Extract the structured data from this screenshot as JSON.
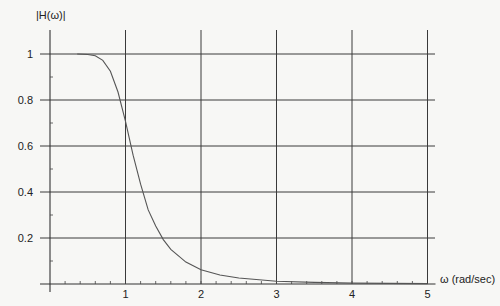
{
  "chart_data": {
    "type": "line",
    "title": "",
    "ylabel": "|H(ω)|",
    "xlabel": "ω (rad/sec)",
    "xlim": [
      0,
      5
    ],
    "ylim": [
      0,
      1
    ],
    "grid": true,
    "legend": null,
    "x_ticks": [
      1,
      2,
      3,
      4,
      5
    ],
    "x_tick_labels": [
      "1",
      "2",
      "3",
      "4",
      "5"
    ],
    "y_ticks": [
      0.2,
      0.4,
      0.6,
      0.8,
      1
    ],
    "y_tick_labels": [
      "0.2",
      "0.4",
      "0.6",
      "0.8",
      "1"
    ],
    "x_minor_tick_step": 0.2,
    "series": [
      {
        "name": "|H(ω)|",
        "x": [
          0.36,
          0.5,
          0.6,
          0.7,
          0.8,
          0.9,
          1.0,
          1.1,
          1.2,
          1.3,
          1.4,
          1.5,
          1.6,
          1.8,
          2.0,
          2.25,
          2.5,
          3.0,
          3.5,
          4.0,
          4.5,
          5.0
        ],
        "values": [
          1.0,
          0.998,
          0.992,
          0.972,
          0.925,
          0.835,
          0.707,
          0.56,
          0.434,
          0.322,
          0.252,
          0.193,
          0.151,
          0.095,
          0.062,
          0.039,
          0.026,
          0.012,
          0.007,
          0.004,
          0.0026,
          0.0016
        ]
      }
    ]
  }
}
